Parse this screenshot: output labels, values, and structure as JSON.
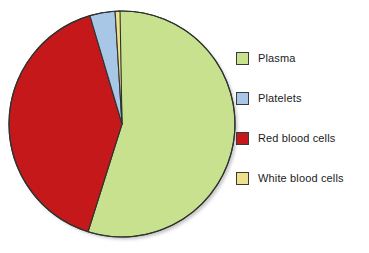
{
  "chart_data": {
    "type": "pie",
    "title": "",
    "subtitle": "",
    "xlabel": "",
    "ylabel": "",
    "grid": false,
    "legend_position": "right",
    "categories": [
      "Plasma",
      "Platelets",
      "Red blood cells",
      "White blood cells"
    ],
    "values": [
      55,
      3.6,
      40.5,
      0.7
    ],
    "units": "percent",
    "slice_angles_deg": [
      199,
      13,
      146,
      2.5
    ],
    "start_angle_deg": -1.5,
    "direction": "clockwise",
    "colors": [
      "#c8e18e",
      "#a8c6e6",
      "#c4181a",
      "#f0e08a"
    ],
    "slices": [
      {
        "label": "Plasma",
        "value": 55,
        "angle_deg": 199,
        "color": "#c8e18e"
      },
      {
        "label": "Red blood cells",
        "value": 40.5,
        "angle_deg": 146,
        "color": "#c4181a"
      },
      {
        "label": "Platelets",
        "value": 3.6,
        "angle_deg": 13,
        "color": "#a8c6e6"
      },
      {
        "label": "White blood cells",
        "value": 0.7,
        "angle_deg": 2.5,
        "color": "#f0e08a"
      }
    ],
    "annotations": []
  },
  "legend": {
    "items": [
      {
        "label": "Plasma",
        "color": "#c8e18e"
      },
      {
        "label": "Platelets",
        "color": "#a8c6e6"
      },
      {
        "label": "Red blood cells",
        "color": "#c4181a"
      },
      {
        "label": "White blood cells",
        "color": "#f0e08a"
      }
    ]
  },
  "style": {
    "background": "#ffffff",
    "outline": "#2e3330",
    "text": "#1b1b1b"
  }
}
